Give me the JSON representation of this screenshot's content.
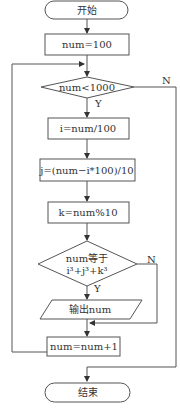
{
  "flowchart": {
    "start": "开始",
    "init": "num=100",
    "loop_condition": "num<1000",
    "step_i": "i=num/100",
    "step_j": "j=(num−i*100)/10",
    "step_k": "k=num%10",
    "check_line1": "num等于",
    "check_line2_base": "i",
    "check_line2": "i³+j³+k³",
    "output": "输出num",
    "increment": "num=num+1",
    "end": "结束",
    "yes_label": "Y",
    "no_label": "N",
    "colors": {
      "stroke": "#555555",
      "text": "#333333",
      "background": "#ffffff"
    }
  }
}
